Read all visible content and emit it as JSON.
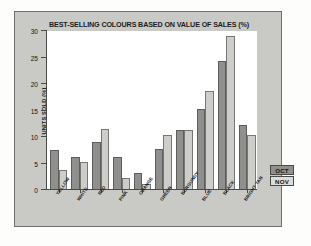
{
  "chart_data": {
    "type": "bar",
    "title": "BEST-SELLING COLOURS BASED ON  VALUE OF SALES (%)",
    "xlabel": "",
    "ylabel": "UNITS SOLD (%)",
    "ylim": [
      0,
      30
    ],
    "ytick_labels": [
      "30",
      "25",
      "20",
      "15",
      "10",
      "5",
      "0"
    ],
    "ytick_values": [
      30,
      25,
      20,
      15,
      10,
      5,
      0
    ],
    "grid": false,
    "legend_position": "right",
    "categories": [
      "YELLOW",
      "WHITE",
      "RED",
      "PINK",
      "ORANGE",
      "GREEN",
      "BURGUNDY",
      "BLUE",
      "BLACK",
      "BRIGHT TAN"
    ],
    "series": [
      {
        "name": "OCT",
        "color": "#8f8f8d",
        "values": [
          7.3,
          6.0,
          8.8,
          6.1,
          3.0,
          7.5,
          11.1,
          15.1,
          24.1,
          12.1
        ]
      },
      {
        "name": "NOV",
        "color": "#cdcdc9",
        "values": [
          3.5,
          5.1,
          11.3,
          2.0,
          1.0,
          10.1,
          11.1,
          18.4,
          28.8,
          10.1
        ]
      }
    ]
  },
  "legend": {
    "items": [
      {
        "label": "OCT"
      },
      {
        "label": "NOV"
      }
    ]
  },
  "colors": {
    "frame_background": "#c9c9c6",
    "plot_background": "#ffffff",
    "axis": "#4a4a48",
    "series_oct": "#8f8f8d",
    "series_nov": "#cdcdc9"
  }
}
